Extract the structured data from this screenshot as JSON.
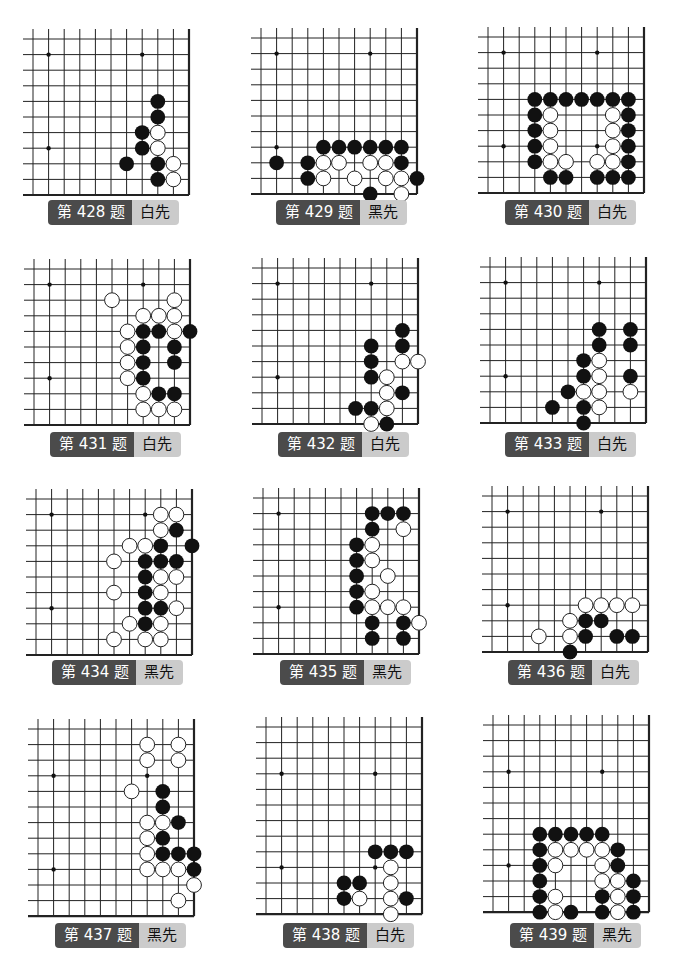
{
  "colors": {
    "label_dark": "#4b4b4b",
    "label_light": "#cbcbcb",
    "black_stone": "#111111",
    "white_stone": "#ffffff"
  },
  "problems": [
    {
      "id": "428",
      "title": "第 428 题",
      "to_play": "白先",
      "x0": 33,
      "y0": 39,
      "rows": 11,
      "label_x": 48,
      "label_y": 200,
      "stars": [
        [
          1,
          1
        ],
        [
          7,
          1
        ],
        [
          1,
          7
        ]
      ],
      "black": [
        [
          8,
          4
        ],
        [
          8,
          5
        ],
        [
          7,
          6
        ],
        [
          7,
          7
        ],
        [
          6,
          8
        ],
        [
          8,
          8
        ],
        [
          8,
          9
        ]
      ],
      "white": [
        [
          8,
          6
        ],
        [
          8,
          7
        ],
        [
          9,
          8
        ],
        [
          9,
          9
        ]
      ]
    },
    {
      "id": "429",
      "title": "第 429 题",
      "to_play": "黑先",
      "x0": 261,
      "y0": 38,
      "rows": 11,
      "label_x": 276,
      "label_y": 200,
      "stars": [
        [
          1,
          1
        ],
        [
          7,
          1
        ],
        [
          1,
          7
        ]
      ],
      "black": [
        [
          4,
          7
        ],
        [
          5,
          7
        ],
        [
          6,
          7
        ],
        [
          7,
          7
        ],
        [
          8,
          7
        ],
        [
          9,
          7
        ],
        [
          1,
          8
        ],
        [
          3,
          8
        ],
        [
          9,
          8
        ],
        [
          3,
          9
        ],
        [
          10,
          9
        ],
        [
          7,
          10
        ]
      ],
      "white": [
        [
          4,
          8
        ],
        [
          5,
          8
        ],
        [
          7,
          8
        ],
        [
          8,
          8
        ],
        [
          4,
          9
        ],
        [
          6,
          9
        ],
        [
          8,
          9
        ],
        [
          9,
          9
        ],
        [
          9,
          10
        ]
      ]
    },
    {
      "id": "430",
      "title": "第 430 题",
      "to_play": "白先",
      "x0": 488,
      "y0": 37,
      "rows": 11,
      "label_x": 505,
      "label_y": 200,
      "stars": [
        [
          1,
          1
        ],
        [
          7,
          1
        ],
        [
          1,
          7
        ],
        [
          7,
          7
        ]
      ],
      "black": [
        [
          3,
          4
        ],
        [
          4,
          4
        ],
        [
          5,
          4
        ],
        [
          6,
          4
        ],
        [
          7,
          4
        ],
        [
          8,
          4
        ],
        [
          9,
          4
        ],
        [
          3,
          5
        ],
        [
          9,
          5
        ],
        [
          3,
          6
        ],
        [
          9,
          6
        ],
        [
          3,
          7
        ],
        [
          9,
          7
        ],
        [
          3,
          8
        ],
        [
          9,
          8
        ],
        [
          4,
          9
        ],
        [
          5,
          9
        ],
        [
          7,
          9
        ],
        [
          8,
          9
        ],
        [
          9,
          9
        ]
      ],
      "white": [
        [
          4,
          5
        ],
        [
          8,
          5
        ],
        [
          4,
          6
        ],
        [
          8,
          6
        ],
        [
          4,
          7
        ],
        [
          8,
          7
        ],
        [
          4,
          8
        ],
        [
          5,
          8
        ],
        [
          7,
          8
        ],
        [
          8,
          8
        ]
      ]
    },
    {
      "id": "431",
      "title": "第 431 题",
      "to_play": "白先",
      "x0": 34,
      "y0": 269,
      "rows": 11,
      "label_x": 50,
      "label_y": 432,
      "stars": [
        [
          1,
          1
        ],
        [
          7,
          1
        ],
        [
          1,
          7
        ]
      ],
      "black": [
        [
          7,
          4
        ],
        [
          8,
          4
        ],
        [
          10,
          4
        ],
        [
          7,
          5
        ],
        [
          9,
          5
        ],
        [
          7,
          6
        ],
        [
          9,
          6
        ],
        [
          7,
          7
        ],
        [
          8,
          8
        ],
        [
          9,
          8
        ]
      ],
      "white": [
        [
          5,
          2
        ],
        [
          9,
          2
        ],
        [
          7,
          3
        ],
        [
          8,
          3
        ],
        [
          9,
          3
        ],
        [
          6,
          4
        ],
        [
          9,
          4
        ],
        [
          6,
          5
        ],
        [
          6,
          6
        ],
        [
          6,
          7
        ],
        [
          7,
          8
        ],
        [
          7,
          9
        ],
        [
          8,
          9
        ],
        [
          9,
          9
        ]
      ]
    },
    {
      "id": "432",
      "title": "第 432 题",
      "to_play": "白先",
      "x0": 262,
      "y0": 268,
      "rows": 11,
      "label_x": 278,
      "label_y": 432,
      "stars": [
        [
          1,
          1
        ],
        [
          7,
          1
        ],
        [
          1,
          7
        ]
      ],
      "black": [
        [
          9,
          4
        ],
        [
          7,
          5
        ],
        [
          9,
          5
        ],
        [
          7,
          6
        ],
        [
          7,
          7
        ],
        [
          9,
          8
        ],
        [
          6,
          9
        ],
        [
          7,
          9
        ],
        [
          8,
          10
        ]
      ],
      "white": [
        [
          9,
          6
        ],
        [
          10,
          6
        ],
        [
          8,
          7
        ],
        [
          8,
          8
        ],
        [
          8,
          9
        ],
        [
          7,
          10
        ]
      ]
    },
    {
      "id": "433",
      "title": "第 433 题",
      "to_play": "白先",
      "x0": 490,
      "y0": 267,
      "rows": 11,
      "label_x": 505,
      "label_y": 432,
      "stars": [
        [
          1,
          1
        ],
        [
          7,
          1
        ],
        [
          1,
          7
        ]
      ],
      "black": [
        [
          7,
          4
        ],
        [
          9,
          4
        ],
        [
          7,
          5
        ],
        [
          9,
          5
        ],
        [
          6,
          6
        ],
        [
          6,
          7
        ],
        [
          9,
          7
        ],
        [
          5,
          8
        ],
        [
          4,
          9
        ],
        [
          6,
          9
        ],
        [
          6,
          10
        ]
      ],
      "white": [
        [
          7,
          6
        ],
        [
          7,
          7
        ],
        [
          6,
          8
        ],
        [
          7,
          8
        ],
        [
          9,
          8
        ],
        [
          7,
          9
        ]
      ]
    },
    {
      "id": "434",
      "title": "第 434 题",
      "to_play": "黑先",
      "x0": 36,
      "y0": 499,
      "rows": 11,
      "label_x": 52,
      "label_y": 660,
      "stars": [
        [
          1,
          1
        ],
        [
          7,
          1
        ],
        [
          1,
          7
        ]
      ],
      "black": [
        [
          9,
          2
        ],
        [
          8,
          3
        ],
        [
          10,
          3
        ],
        [
          7,
          4
        ],
        [
          8,
          4
        ],
        [
          9,
          4
        ],
        [
          7,
          5
        ],
        [
          7,
          6
        ],
        [
          7,
          7
        ],
        [
          8,
          7
        ],
        [
          7,
          8
        ]
      ],
      "white": [
        [
          8,
          1
        ],
        [
          9,
          1
        ],
        [
          8,
          2
        ],
        [
          6,
          3
        ],
        [
          7,
          3
        ],
        [
          5,
          4
        ],
        [
          8,
          5
        ],
        [
          9,
          5
        ],
        [
          5,
          6
        ],
        [
          8,
          6
        ],
        [
          9,
          7
        ],
        [
          6,
          8
        ],
        [
          8,
          8
        ],
        [
          5,
          9
        ],
        [
          7,
          9
        ],
        [
          8,
          9
        ]
      ]
    },
    {
      "id": "435",
      "title": "第 435 题",
      "to_play": "黑先",
      "x0": 263,
      "y0": 498,
      "rows": 11,
      "label_x": 280,
      "label_y": 660,
      "stars": [
        [
          1,
          1
        ],
        [
          7,
          1
        ],
        [
          1,
          7
        ]
      ],
      "black": [
        [
          7,
          1
        ],
        [
          8,
          1
        ],
        [
          9,
          1
        ],
        [
          7,
          2
        ],
        [
          6,
          3
        ],
        [
          6,
          4
        ],
        [
          6,
          5
        ],
        [
          6,
          6
        ],
        [
          6,
          7
        ],
        [
          7,
          8
        ],
        [
          9,
          8
        ],
        [
          7,
          9
        ],
        [
          9,
          9
        ]
      ],
      "white": [
        [
          9,
          2
        ],
        [
          7,
          3
        ],
        [
          7,
          4
        ],
        [
          8,
          5
        ],
        [
          7,
          6
        ],
        [
          7,
          7
        ],
        [
          8,
          7
        ],
        [
          9,
          7
        ],
        [
          10,
          8
        ]
      ]
    },
    {
      "id": "436",
      "title": "第 436 题",
      "to_play": "白先",
      "x0": 492,
      "y0": 496,
      "rows": 11,
      "label_x": 508,
      "label_y": 660,
      "stars": [
        [
          1,
          1
        ],
        [
          7,
          1
        ],
        [
          1,
          7
        ]
      ],
      "black": [
        [
          6,
          8
        ],
        [
          7,
          8
        ],
        [
          6,
          9
        ],
        [
          8,
          9
        ],
        [
          9,
          9
        ],
        [
          5,
          10
        ]
      ],
      "white": [
        [
          6,
          7
        ],
        [
          7,
          7
        ],
        [
          8,
          7
        ],
        [
          9,
          7
        ],
        [
          5,
          8
        ],
        [
          3,
          9
        ],
        [
          5,
          9
        ]
      ]
    },
    {
      "id": "437",
      "title": "第 437 题",
      "to_play": "黑先",
      "x0": 38,
      "y0": 729,
      "rows": 13,
      "label_x": 55,
      "label_y": 923,
      "stars": [
        [
          1,
          3
        ],
        [
          7,
          3
        ],
        [
          1,
          9
        ]
      ],
      "black": [
        [
          8,
          4
        ],
        [
          8,
          5
        ],
        [
          9,
          6
        ],
        [
          8,
          7
        ],
        [
          8,
          8
        ],
        [
          9,
          8
        ],
        [
          10,
          8
        ],
        [
          10,
          9
        ]
      ],
      "white": [
        [
          7,
          1
        ],
        [
          9,
          1
        ],
        [
          7,
          2
        ],
        [
          9,
          2
        ],
        [
          6,
          4
        ],
        [
          7,
          6
        ],
        [
          8,
          6
        ],
        [
          7,
          7
        ],
        [
          7,
          8
        ],
        [
          7,
          9
        ],
        [
          8,
          9
        ],
        [
          9,
          9
        ],
        [
          10,
          10
        ],
        [
          9,
          11
        ]
      ]
    },
    {
      "id": "438",
      "title": "第 438 题",
      "to_play": "白先",
      "x0": 266,
      "y0": 727,
      "rows": 13,
      "label_x": 283,
      "label_y": 923,
      "stars": [
        [
          1,
          3
        ],
        [
          7,
          3
        ],
        [
          1,
          9
        ],
        [
          7,
          9
        ]
      ],
      "black": [
        [
          7,
          8
        ],
        [
          8,
          8
        ],
        [
          9,
          8
        ],
        [
          5,
          10
        ],
        [
          6,
          10
        ],
        [
          5,
          11
        ],
        [
          9,
          11
        ]
      ],
      "white": [
        [
          8,
          9
        ],
        [
          8,
          10
        ],
        [
          6,
          11
        ],
        [
          8,
          11
        ],
        [
          8,
          12
        ]
      ]
    },
    {
      "id": "439",
      "title": "第 439 题",
      "to_play": "黑先",
      "x0": 493,
      "y0": 725,
      "rows": 13,
      "label_x": 510,
      "label_y": 923,
      "stars": [
        [
          1,
          3
        ],
        [
          7,
          3
        ],
        [
          1,
          9
        ]
      ],
      "black": [
        [
          3,
          7
        ],
        [
          4,
          7
        ],
        [
          5,
          7
        ],
        [
          6,
          7
        ],
        [
          7,
          7
        ],
        [
          3,
          8
        ],
        [
          8,
          8
        ],
        [
          3,
          9
        ],
        [
          8,
          9
        ],
        [
          3,
          10
        ],
        [
          9,
          10
        ],
        [
          3,
          11
        ],
        [
          7,
          11
        ],
        [
          9,
          11
        ],
        [
          3,
          12
        ],
        [
          5,
          12
        ],
        [
          7,
          12
        ],
        [
          9,
          12
        ]
      ],
      "white": [
        [
          4,
          8
        ],
        [
          5,
          8
        ],
        [
          6,
          8
        ],
        [
          7,
          8
        ],
        [
          4,
          9
        ],
        [
          7,
          9
        ],
        [
          7,
          10
        ],
        [
          8,
          10
        ],
        [
          4,
          11
        ],
        [
          8,
          11
        ],
        [
          4,
          12
        ],
        [
          8,
          12
        ]
      ]
    }
  ]
}
